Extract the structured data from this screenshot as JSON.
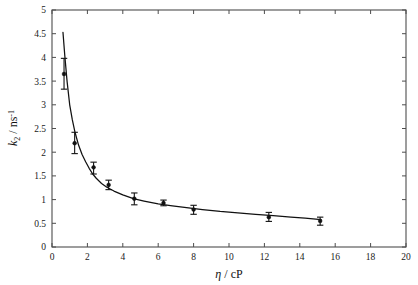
{
  "figure": {
    "background_color": "#ffffff",
    "foreground_color": "#111111",
    "axis_color": "#4d4d4d"
  },
  "chart_data": {
    "type": "scatter",
    "title": "",
    "subtitle": "",
    "xlabel": "η / cP",
    "ylabel": "k_2 / ns^-1",
    "ylabel_parts": {
      "symbol": "k",
      "subscript": "_2",
      "separator": " / ",
      "unit": "ns",
      "superscript": "^-1"
    },
    "xlim": [
      0,
      20
    ],
    "ylim": [
      0,
      5
    ],
    "xticks": [
      0,
      2,
      4,
      6,
      8,
      10,
      12,
      14,
      16,
      18,
      20
    ],
    "xticklabels": [
      "0",
      "2",
      "4",
      "6",
      "8",
      "10",
      "12",
      "14",
      "16",
      "18",
      "20"
    ],
    "yticks": [
      0,
      0.5,
      1,
      1.5,
      2,
      2.5,
      3,
      3.5,
      4,
      4.5,
      5
    ],
    "yticklabels": [
      "0",
      "0.5",
      "1",
      "1.5",
      "2",
      "2.5",
      "3",
      "3.5",
      "4",
      "4.5",
      "5"
    ],
    "grid": false,
    "legend": null,
    "legend_position": "none",
    "tick_direction": "in",
    "box_frame": true,
    "marker_style": "filled-circle",
    "errorbar_style": "vertical-capped",
    "series": [
      {
        "name": "measured rate constants",
        "x": [
          0.68,
          1.28,
          2.35,
          3.2,
          4.65,
          6.3,
          8.0,
          12.25,
          15.15
        ],
        "y": [
          3.65,
          2.19,
          1.68,
          1.31,
          1.02,
          0.93,
          0.79,
          0.63,
          0.55
        ],
        "yerr_lower": [
          0.32,
          0.22,
          0.14,
          0.1,
          0.13,
          0.06,
          0.1,
          0.09,
          0.09
        ],
        "yerr_upper": [
          0.33,
          0.23,
          0.11,
          0.1,
          0.12,
          0.06,
          0.09,
          0.1,
          0.08
        ]
      }
    ],
    "fit_curve": {
      "name": "fitted decay curve",
      "x": [
        0.62,
        0.72,
        0.85,
        1.0,
        1.15,
        1.3,
        1.5,
        1.7,
        1.9,
        2.1,
        2.3,
        2.5,
        2.8,
        3.1,
        3.5,
        4.0,
        4.6,
        5.2,
        6.0,
        6.8,
        7.6,
        8.5,
        9.5,
        10.5,
        11.5,
        12.5,
        13.5,
        14.3,
        15.2
      ],
      "y": [
        4.53,
        4.05,
        3.5,
        3.0,
        2.68,
        2.42,
        2.15,
        1.95,
        1.8,
        1.66,
        1.54,
        1.45,
        1.34,
        1.26,
        1.18,
        1.1,
        1.02,
        0.97,
        0.91,
        0.87,
        0.83,
        0.79,
        0.75,
        0.72,
        0.69,
        0.66,
        0.63,
        0.61,
        0.58
      ]
    }
  }
}
